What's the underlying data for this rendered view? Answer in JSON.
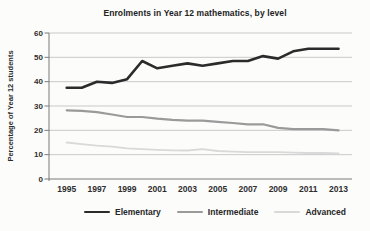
{
  "chart": {
    "title": "Enrolments in Year 12 mathematics, by level",
    "ylabel": "Percentage of Year 12 students"
  },
  "chart_data": {
    "type": "line",
    "title": "Enrolments in Year 12 mathematics, by level",
    "xlabel": "",
    "ylabel": "Percentage of Year 12 students",
    "x": [
      1995,
      1996,
      1997,
      1998,
      1999,
      2000,
      2001,
      2002,
      2003,
      2004,
      2005,
      2006,
      2007,
      2008,
      2009,
      2010,
      2011,
      2012,
      2013
    ],
    "x_tick_labels": [
      "1995",
      "1997",
      "1999",
      "2001",
      "2003",
      "2005",
      "2007",
      "2009",
      "2011",
      "2013"
    ],
    "ylim": [
      0,
      60
    ],
    "yticks": [
      0,
      10,
      20,
      30,
      40,
      50,
      60
    ],
    "grid": true,
    "legend_position": "bottom",
    "series": [
      {
        "name": "Elementary",
        "color": "#2b2b2b",
        "stroke_width": 2.6,
        "values": [
          37.5,
          37.5,
          40,
          39.5,
          41,
          48.5,
          45.5,
          46.5,
          47.5,
          46.5,
          47.5,
          48.5,
          48.5,
          50.5,
          49.5,
          52.5,
          53.5,
          53.5,
          53.5
        ]
      },
      {
        "name": "Intermediate",
        "color": "#9a9a9a",
        "stroke_width": 2.2,
        "values": [
          28.2,
          28,
          27.5,
          26.5,
          25.5,
          25.5,
          24.8,
          24.3,
          24,
          24,
          23.5,
          23,
          22.5,
          22.5,
          21,
          20.5,
          20.5,
          20.5,
          20
        ]
      },
      {
        "name": "Advanced",
        "color": "#d9d9d9",
        "stroke_width": 1.8,
        "values": [
          15,
          14.3,
          13.7,
          13.3,
          12.6,
          12.3,
          12,
          11.8,
          11.7,
          12.3,
          11.5,
          11.2,
          11,
          11,
          11,
          10.8,
          10.7,
          10.7,
          10.5
        ]
      }
    ],
    "axis_color": "#7a7a7a",
    "grid_color": "#c9c9c9",
    "tick_label_color": "#2e2e2e"
  }
}
